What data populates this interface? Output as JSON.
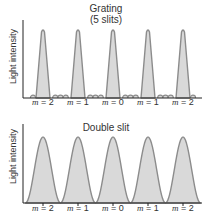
{
  "chart_data": [
    {
      "type": "line",
      "title": "Grating (5 slits)",
      "title_lines": [
        "Grating",
        "(5 slits)"
      ],
      "ylabel": "Light intensity",
      "xlabel": "",
      "categories": [
        "m = 2",
        "m = 1",
        "m = 0",
        "m = 1",
        "m = 2"
      ],
      "orders": [
        2,
        1,
        0,
        1,
        2
      ],
      "principal_max_relative_height": 1.0,
      "principal_max_width": "narrow",
      "secondary_maxima_between_principals": 3,
      "secondary_max_relative_height": 0.05,
      "fill_color": "#d9d9d9",
      "stroke_color": "#8c8c8c"
    },
    {
      "type": "line",
      "title": "Double slit",
      "ylabel": "Light intensity",
      "xlabel": "",
      "categories": [
        "m = 2",
        "m = 1",
        "m = 0",
        "m = 1",
        "m = 2"
      ],
      "orders": [
        2,
        1,
        0,
        1,
        2
      ],
      "principal_max_relative_height": 1.0,
      "principal_max_width": "broad (cos² fringes)",
      "secondary_maxima_between_principals": 0,
      "fill_color": "#d9d9d9",
      "stroke_color": "#8c8c8c"
    }
  ],
  "top": {
    "title_line1": "Grating",
    "title_line2": "(5 slits)",
    "ylabel": "Light intensity",
    "labels": [
      {
        "m": "m",
        "eq": " = 2"
      },
      {
        "m": "m",
        "eq": " = 1"
      },
      {
        "m": "m",
        "eq": " = 0"
      },
      {
        "m": "m",
        "eq": " = 1"
      },
      {
        "m": "m",
        "eq": " = 2"
      }
    ]
  },
  "bottom": {
    "title": "Double slit",
    "ylabel": "Light intensity",
    "labels": [
      {
        "m": "m",
        "eq": " = 2"
      },
      {
        "m": "m",
        "eq": " = 1"
      },
      {
        "m": "m",
        "eq": " = 0"
      },
      {
        "m": "m",
        "eq": " = 1"
      },
      {
        "m": "m",
        "eq": " = 2"
      }
    ]
  },
  "colors": {
    "fill": "#d9d9d9",
    "stroke": "#8c8c8c",
    "axis": "#222222"
  }
}
